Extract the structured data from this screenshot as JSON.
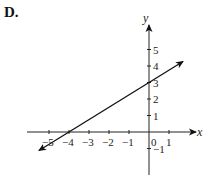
{
  "option_label": "D.",
  "chart_data": {
    "type": "line",
    "title": "",
    "xlabel": "x",
    "ylabel": "y",
    "x_ticks": [
      -5,
      -4,
      -3,
      -2,
      -1,
      0,
      1
    ],
    "y_ticks": [
      -1,
      1,
      2,
      3,
      4,
      5
    ],
    "xlim": [
      -6,
      2.3
    ],
    "ylim": [
      -2.6,
      6.6
    ],
    "grid": false,
    "series": [
      {
        "name": "line",
        "equation": "y = 0.75x + 3",
        "x_intercept": -4,
        "y_intercept": 3,
        "points": [
          [
            -5.5,
            -1.125
          ],
          [
            1.7,
            4.275
          ]
        ],
        "arrows": "both"
      }
    ]
  }
}
